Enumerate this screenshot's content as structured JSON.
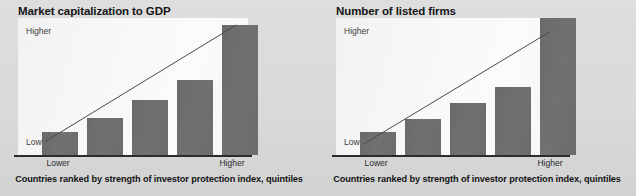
{
  "page": {
    "background_color": "#dcdcdc",
    "bar_color": "#6e6e6e",
    "plot_background_color": "#f7f7f7",
    "axis_color": "#2b2b2b",
    "trend_line_color": "#4a4a4a"
  },
  "charts": [
    {
      "id": "market-capitalization-to-gdp",
      "title": "Market capitalization to GDP",
      "caption": "Countries ranked by strength of investor protection index, quintiles",
      "y_axis_top_label": "Higher",
      "y_axis_bottom_label": "Lower",
      "x_axis_left_label": "Lower",
      "x_axis_right_label": "Higher"
    },
    {
      "id": "number-of-listed-firms",
      "title": "Number of listed firms",
      "caption": "Countries ranked by strength of investor protection index, quintiles",
      "y_axis_top_label": "Higher",
      "y_axis_bottom_label": "Lower",
      "x_axis_left_label": "Lower",
      "x_axis_right_label": "Higher"
    }
  ],
  "chart_data": [
    {
      "type": "bar",
      "title": "Market capitalization to GDP",
      "xlabel": "Countries ranked by strength of investor protection index, quintiles",
      "ylabel": "Market capitalization to GDP",
      "categories": [
        "1",
        "2",
        "3",
        "4",
        "5"
      ],
      "category_labels": [
        "Lower",
        "",
        "",
        "",
        "Higher"
      ],
      "values": [
        0.17,
        0.27,
        0.4,
        0.55,
        0.95
      ],
      "ylim": [
        0,
        1
      ],
      "ytick_labels": [
        "Lower",
        "Higher"
      ],
      "grid": false,
      "legend": false,
      "annotations": [
        {
          "type": "trend-line",
          "from": [
            0.12,
            0.1
          ],
          "to": [
            0.95,
            0.95
          ],
          "style": "solid"
        }
      ]
    },
    {
      "type": "bar",
      "title": "Number of listed firms",
      "xlabel": "Countries ranked by strength of investor protection index, quintiles",
      "ylabel": "Number of listed firms",
      "categories": [
        "1",
        "2",
        "3",
        "4",
        "5"
      ],
      "category_labels": [
        "Lower",
        "",
        "",
        "",
        "Higher"
      ],
      "values": [
        0.17,
        0.26,
        0.38,
        0.5,
        1.0
      ],
      "ylim": [
        0,
        1
      ],
      "ytick_labels": [
        "Lower",
        "Higher"
      ],
      "grid": false,
      "legend": false,
      "annotations": [
        {
          "type": "trend-line",
          "from": [
            0.12,
            0.08
          ],
          "to": [
            0.93,
            0.9
          ],
          "style": "solid"
        }
      ]
    }
  ]
}
